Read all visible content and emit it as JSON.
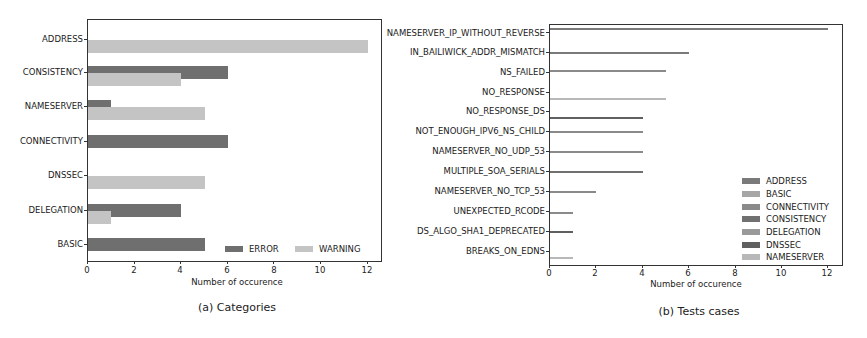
{
  "colors": {
    "error": "#6f6f6f",
    "warning": "#c4c4c4",
    "ADDRESS": "#7a7a7a",
    "BASIC": "#a6a6a6",
    "CONNECTIVITY": "#8a8a8a",
    "CONSISTENCY": "#707070",
    "DELEGATION": "#9a9a9a",
    "DNSSEC": "#606060",
    "NAMESERVER": "#b8b8b8"
  },
  "chart_data": [
    {
      "type": "bar",
      "orientation": "horizontal",
      "title": "(a) Categories",
      "xlabel": "Number of occurence",
      "ylabel": "",
      "xlim": [
        0,
        12.6
      ],
      "xticks": [
        0,
        2,
        4,
        6,
        8,
        10,
        12
      ],
      "grid": false,
      "legend_position": "lower right",
      "categories": [
        "ADDRESS",
        "CONSISTENCY",
        "NAMESERVER",
        "CONNECTIVITY",
        "DNSSEC",
        "DELEGATION",
        "BASIC"
      ],
      "series": [
        {
          "name": "ERROR",
          "values": [
            0,
            6,
            1,
            6,
            0,
            4,
            5
          ]
        },
        {
          "name": "WARNING",
          "values": [
            12,
            4,
            5,
            0,
            5,
            1,
            0
          ]
        }
      ]
    },
    {
      "type": "bar",
      "orientation": "horizontal",
      "title": "(b) Tests cases",
      "xlabel": "Number of occurence",
      "ylabel": "",
      "xlim": [
        0,
        12.6
      ],
      "xticks": [
        0,
        2,
        4,
        6,
        8,
        10,
        12
      ],
      "grid": false,
      "legend_position": "lower right",
      "legend": [
        "ADDRESS",
        "BASIC",
        "CONNECTIVITY",
        "CONSISTENCY",
        "DELEGATION",
        "DNSSEC",
        "NAMESERVER"
      ],
      "categories": [
        "NAMESERVER_IP_WITHOUT_REVERSE",
        "IN_BAILIWICK_ADDR_MISMATCH",
        "NS_FAILED",
        "NO_RESPONSE",
        "NO_RESPONSE_DS",
        "NOT_ENOUGH_IPV6_NS_CHILD",
        "NAMESERVER_NO_UDP_53",
        "MULTIPLE_SOA_SERIALS",
        "NAMESERVER_NO_TCP_53",
        "UNEXPECTED_RCODE",
        "DS_ALGO_SHA1_DEPRECATED",
        "BREAKS_ON_EDNS"
      ],
      "values": [
        12,
        6,
        5,
        5,
        4,
        4,
        4,
        4,
        2,
        1,
        1,
        1
      ],
      "value_categories": [
        "ADDRESS",
        "ADDRESS",
        "CONNECTIVITY",
        "NAMESERVER",
        "DNSSEC",
        "CONNECTIVITY",
        "CONNECTIVITY",
        "CONSISTENCY",
        "CONNECTIVITY",
        "CONNECTIVITY",
        "DNSSEC",
        "NAMESERVER"
      ]
    }
  ],
  "chartA": {
    "caption": "(a) Categories",
    "xlabel": "Number of occurence",
    "xticks": [
      "0",
      "2",
      "4",
      "6",
      "8",
      "10",
      "12"
    ],
    "labels": [
      "ADDRESS",
      "CONSISTENCY",
      "NAMESERVER",
      "CONNECTIVITY",
      "DNSSEC",
      "DELEGATION",
      "BASIC"
    ],
    "legend": {
      "error": "ERROR",
      "warning": "WARNING"
    }
  },
  "chartB": {
    "caption": "(b) Tests cases",
    "xlabel": "Number of occurence",
    "xticks": [
      "0",
      "2",
      "4",
      "6",
      "8",
      "10",
      "12"
    ],
    "labels": [
      "NAMESERVER_IP_WITHOUT_REVERSE",
      "IN_BAILIWICK_ADDR_MISMATCH",
      "NS_FAILED",
      "NO_RESPONSE",
      "NO_RESPONSE_DS",
      "NOT_ENOUGH_IPV6_NS_CHILD",
      "NAMESERVER_NO_UDP_53",
      "MULTIPLE_SOA_SERIALS",
      "NAMESERVER_NO_TCP_53",
      "UNEXPECTED_RCODE",
      "DS_ALGO_SHA1_DEPRECATED",
      "BREAKS_ON_EDNS"
    ],
    "legend": [
      "ADDRESS",
      "BASIC",
      "CONNECTIVITY",
      "CONSISTENCY",
      "DELEGATION",
      "DNSSEC",
      "NAMESERVER"
    ]
  }
}
